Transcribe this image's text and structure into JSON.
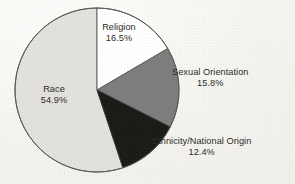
{
  "chart_data": {
    "type": "pie",
    "title": "",
    "subtitle": "",
    "xlabel": "",
    "ylabel": "",
    "legend_position": "none",
    "grid": false,
    "start_angle_deg": 0,
    "direction": "clockwise",
    "units": "percent",
    "categories": [
      "Religion",
      "Sexual Orientation",
      "Ethnicity/National Origin",
      "Race"
    ],
    "values": [
      16.5,
      15.8,
      12.4,
      54.9
    ],
    "colors": [
      "#ffffff",
      "#7d7d7d",
      "#1c1a17",
      "#e2e1dd"
    ],
    "slices": [
      {
        "label": "Religion",
        "value": 16.5,
        "value_text": "16.5%",
        "color": "#ffffff",
        "label_placement": "inside",
        "start_deg": 0.0,
        "end_deg": 59.4
      },
      {
        "label": "Sexual Orientation",
        "value": 15.8,
        "value_text": "15.8%",
        "color": "#7d7d7d",
        "label_placement": "outside-right",
        "start_deg": 59.4,
        "end_deg": 116.3
      },
      {
        "label": "Ethnicity/National Origin",
        "value": 12.4,
        "value_text": "12.4%",
        "color": "#1c1a17",
        "label_placement": "outside-right",
        "start_deg": 116.3,
        "end_deg": 160.9
      },
      {
        "label": "Race",
        "value": 54.9,
        "value_text": "54.9%",
        "color": "#e2e1dd",
        "label_placement": "inside",
        "start_deg": 160.9,
        "end_deg": 360.0
      }
    ]
  },
  "figure": {
    "background_color": "#f7f6f3",
    "outline_color": "#5a5954",
    "text_color": "#2b2a27"
  }
}
